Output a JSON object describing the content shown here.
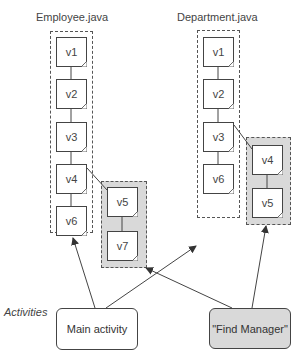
{
  "files": [
    {
      "name": "Employee.java",
      "main_versions": [
        "v1",
        "v2",
        "v3",
        "v4",
        "v6"
      ],
      "branch_versions": [
        "v5",
        "v7"
      ],
      "branch_from": "v4"
    },
    {
      "name": "Department.java",
      "main_versions": [
        "v1",
        "v2",
        "v3",
        "v6"
      ],
      "branch_versions": [
        "v4",
        "v5"
      ],
      "branch_from": "v3"
    }
  ],
  "activities": {
    "label": "Activities",
    "items": [
      {
        "name": "Main activity",
        "style": "white"
      },
      {
        "name": "\"Find Manager\"",
        "style": "gray"
      }
    ]
  },
  "colors": {
    "branch_fill": "#d9d9d9",
    "line": "#444444"
  }
}
